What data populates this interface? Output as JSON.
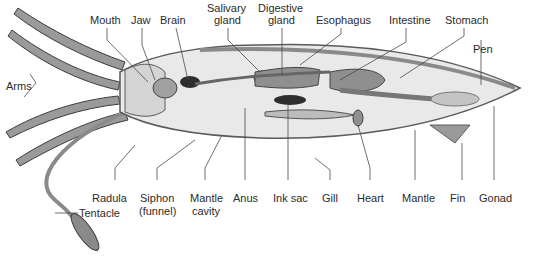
{
  "diagram": {
    "colors": {
      "body_fill": "#e9e9e9",
      "body_stroke": "#5a5a5a",
      "organ_fill": "#8f8f8f",
      "organ_dark": "#2e2e2e",
      "leader_line": "#4a4a4a",
      "label_text": "#2b2b2b"
    },
    "labels": {
      "mouth": "Mouth",
      "jaw": "Jaw",
      "brain": "Brain",
      "salivary_gland_1": "Salivary",
      "salivary_gland_2": "gland",
      "digestive_gland_1": "Digestive",
      "digestive_gland_2": "gland",
      "esophagus": "Esophagus",
      "intestine": "Intestine",
      "stomach": "Stomach",
      "pen": "Pen",
      "arms": "Arms",
      "radula": "Radula",
      "siphon_1": "Siphon",
      "siphon_2": "(funnel)",
      "mantle_cavity_1": "Mantle",
      "mantle_cavity_2": "cavity",
      "anus": "Anus",
      "ink_sac": "Ink sac",
      "gill": "Gill",
      "heart": "Heart",
      "mantle": "Mantle",
      "fin": "Fin",
      "gonad": "Gonad",
      "tentacle": "Tentacle"
    }
  }
}
